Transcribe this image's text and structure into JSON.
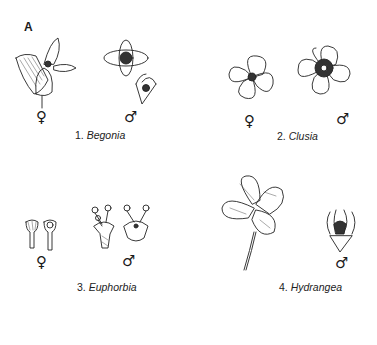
{
  "figure": {
    "panel_letter": "A",
    "taxa": [
      {
        "number": "1.",
        "name": "Begonia",
        "sexes": [
          "♀",
          "♂"
        ]
      },
      {
        "number": "2.",
        "name": "Clusia",
        "sexes": [
          "♀",
          "♂"
        ]
      },
      {
        "number": "3.",
        "name": "Euphorbia",
        "sexes": [
          "♀",
          "♂"
        ]
      },
      {
        "number": "4.",
        "name": "Hydrangea",
        "sexes": [
          "♂"
        ]
      }
    ],
    "colors": {
      "line": "#222222",
      "background": "#ffffff"
    }
  }
}
